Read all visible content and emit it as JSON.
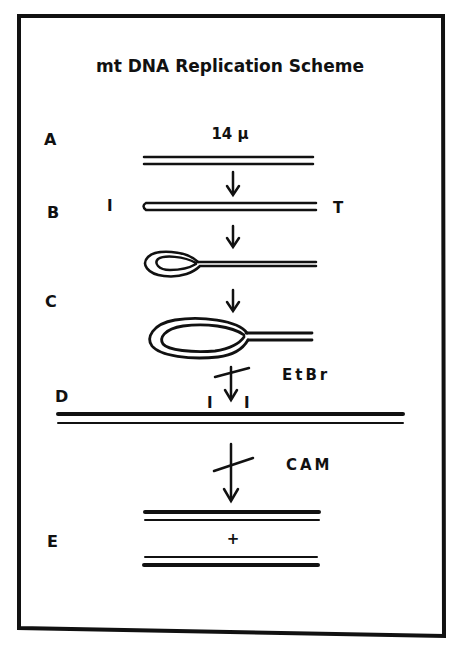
{
  "title": "mt DNA Replication Scheme",
  "stages": [
    {
      "id": "A",
      "label": "A",
      "annotation": "14 μ"
    },
    {
      "id": "B",
      "label": "B",
      "left_marker": "I",
      "right_marker": "T"
    },
    {
      "id": "C",
      "label": "C"
    },
    {
      "id": "D",
      "label": "D",
      "inhibitor": "EtBr",
      "markers": [
        "I",
        "I"
      ]
    },
    {
      "id": "E",
      "label": "E",
      "inhibitor": "CAM",
      "join_symbol": "+"
    }
  ],
  "colors": {
    "ink": "#111111",
    "paper": "#ffffff"
  }
}
